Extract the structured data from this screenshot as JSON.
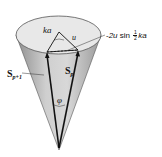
{
  "diagram": {
    "labels": {
      "ka": "ka",
      "u": "u",
      "chord_prefix": "2u",
      "chord_func": "sin",
      "chord_frac_num": "1",
      "chord_frac_den": "2",
      "chord_suffix": "ka",
      "s_p1_main": "S",
      "s_p1_sub": "p+1",
      "s_p_main": "S",
      "s_p_sub": "p",
      "phi": "φ"
    },
    "colors": {
      "cone_fill": "#c8c8c8",
      "cone_inner": "#e6e6e6",
      "cone_shadow": "#9a9a9a",
      "vector": "#111111"
    }
  }
}
